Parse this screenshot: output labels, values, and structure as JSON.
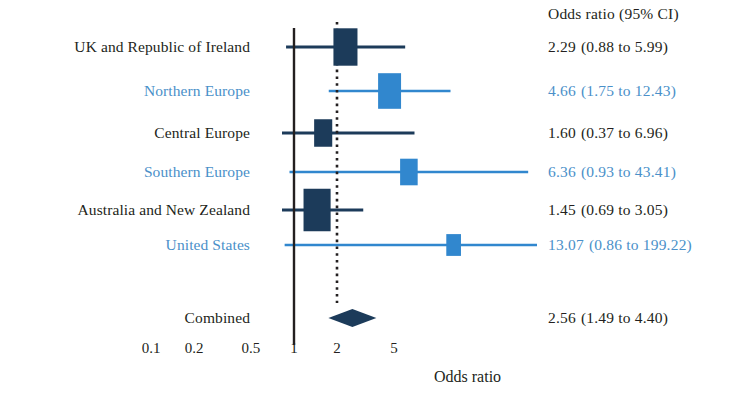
{
  "figure": {
    "axis_title": "Odds ratio",
    "value_column_header": "Odds ratio  (95% CI)",
    "colors": {
      "dark_navy": "#1c3b5a",
      "light_blue": "#3187ce",
      "label_blue": "#4a90c9",
      "text_dark": "#231f20",
      "background": "#ffffff"
    }
  },
  "chart_data": {
    "type": "forest",
    "title": "",
    "xlabel": "Odds ratio",
    "ylabel": "",
    "scale": "log",
    "xlim": [
      0.08,
      9.5
    ],
    "ticks": [
      "0.1",
      "0.2",
      "0.5",
      "1",
      "2",
      "5"
    ],
    "tick_values": [
      0.1,
      0.2,
      0.5,
      1,
      2,
      5
    ],
    "null_line": 1,
    "summary_line": 2.56,
    "grid": false,
    "legend": "none",
    "rows": [
      {
        "label": "UK and Republic of Ireland",
        "color": "dark",
        "estimate": 2.29,
        "ci_low": 0.88,
        "ci_high": 5.99,
        "estimate_text": "2.29",
        "ci_text": "(0.88 to 5.99)",
        "weight": 0.78
      },
      {
        "label": "Northern Europe",
        "color": "blue",
        "estimate": 4.66,
        "ci_low": 1.75,
        "ci_high": 12.43,
        "estimate_text": "4.66",
        "ci_text": "(1.75 to 12.43)",
        "weight": 0.72
      },
      {
        "label": "Central Europe",
        "color": "dark",
        "estimate": 1.6,
        "ci_low": 0.37,
        "ci_high": 6.96,
        "estimate_text": "1.60",
        "ci_text": "(0.37 to 6.96)",
        "weight": 0.45
      },
      {
        "label": "Southern Europe",
        "color": "blue",
        "estimate": 6.36,
        "ci_low": 0.93,
        "ci_high": 43.41,
        "estimate_text": "6.36",
        "ci_text": "(0.93 to 43.41)",
        "weight": 0.42
      },
      {
        "label": "Australia and New Zealand",
        "color": "dark",
        "estimate": 1.45,
        "ci_low": 0.69,
        "ci_high": 3.05,
        "estimate_text": "1.45",
        "ci_text": "(0.69 to 3.05)",
        "weight": 0.95
      },
      {
        "label": "United States",
        "color": "blue",
        "estimate": 13.07,
        "ci_low": 0.86,
        "ci_high": 199.22,
        "estimate_text": "13.07",
        "ci_text": "(0.86 to 199.22)",
        "weight": 0.26
      },
      {
        "label": "Combined",
        "color": "dark",
        "estimate": 2.56,
        "ci_low": 1.49,
        "ci_high": 4.4,
        "estimate_text": "2.56",
        "ci_text": "(1.49 to 4.40)",
        "weight": 1.0,
        "is_summary": true
      }
    ]
  }
}
